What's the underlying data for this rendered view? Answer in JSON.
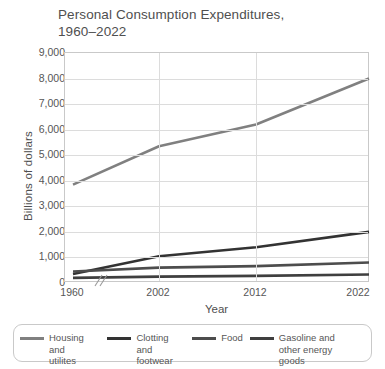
{
  "chart_data": {
    "type": "line",
    "title": "Personal Consumption Expenditures,\n1960–2022",
    "xlabel": "Year",
    "ylabel": "Billions of dollars",
    "categories": [
      "1960",
      "2002",
      "2012",
      "2022"
    ],
    "x_tick_labels": [
      "1960",
      "2002",
      "2012",
      "2022"
    ],
    "y_tick_labels": [
      "0",
      "1,000",
      "2,000",
      "3,000",
      "4,000",
      "5,000",
      "6,000",
      "7,000",
      "8,000",
      "9,000"
    ],
    "ylim": [
      0,
      9000
    ],
    "y_tick_step": 1000,
    "grid": "horizontal-and-vertical",
    "axis_break": true,
    "axis_break_note": "//",
    "legend_position": "bottom",
    "series": [
      {
        "name": "Housing and utilites",
        "legend_label": "Housing and\nutilites",
        "color": "#808080",
        "values": [
          3850,
          5350,
          6200,
          8000
        ]
      },
      {
        "name": "Clotting and footwear",
        "legend_label": "Clotting and\nfootwear",
        "color": "#333333",
        "values": [
          350,
          1050,
          1400,
          2000
        ]
      },
      {
        "name": "Food",
        "legend_label": "Food",
        "color": "#4d4d4d",
        "values": [
          450,
          600,
          660,
          800
        ]
      },
      {
        "name": "Gasoline and other energy goods",
        "legend_label": "Gasoline and\nother energy goods",
        "color": "#3f3f3f",
        "values": [
          200,
          250,
          280,
          330
        ]
      }
    ]
  },
  "colors": {
    "axis": "#c9c9c9",
    "grid": "#dcdcdc",
    "text": "#4f4f4f",
    "tick_text": "#565656"
  }
}
